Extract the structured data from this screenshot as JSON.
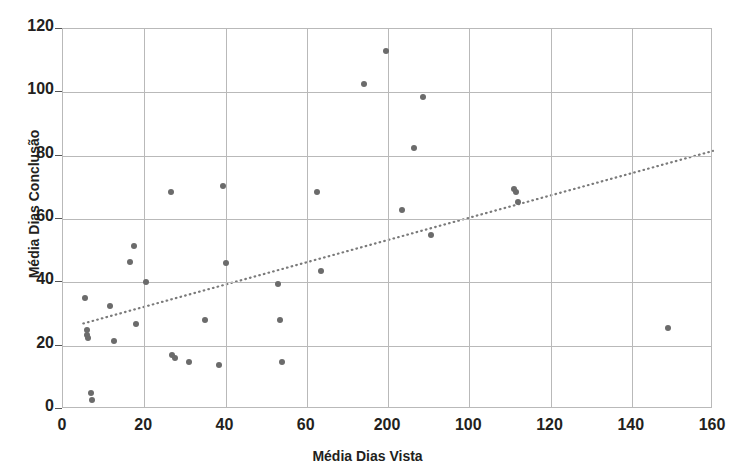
{
  "chart_data": {
    "type": "scatter",
    "title": "",
    "xlabel": "Média Dias Vista",
    "ylabel": "Média Dias Conclusão",
    "xlim": [
      0,
      160
    ],
    "ylim": [
      0,
      120
    ],
    "xticks": [
      0,
      20,
      40,
      60,
      200,
      100,
      120,
      140,
      160
    ],
    "xtick_positions": [
      0,
      20,
      40,
      60,
      80,
      100,
      120,
      140,
      160
    ],
    "yticks": [
      0,
      20,
      40,
      60,
      80,
      100,
      120
    ],
    "grid": true,
    "legend": false,
    "marker_color": "#6b6b6b",
    "trendline_color": "#7a7a7a",
    "series": [
      {
        "name": "Observações",
        "points": [
          [
            5.5,
            35.0
          ],
          [
            6.0,
            25.0
          ],
          [
            6.0,
            23.5
          ],
          [
            6.2,
            22.5
          ],
          [
            7.0,
            5.0
          ],
          [
            7.2,
            3.0
          ],
          [
            11.5,
            32.5
          ],
          [
            12.5,
            21.5
          ],
          [
            16.5,
            46.5
          ],
          [
            17.5,
            51.5
          ],
          [
            18.0,
            27.0
          ],
          [
            20.5,
            40.0
          ],
          [
            26.5,
            68.5
          ],
          [
            26.8,
            17.0
          ],
          [
            27.5,
            16.0
          ],
          [
            31.0,
            15.0
          ],
          [
            35.0,
            28.0
          ],
          [
            38.5,
            14.0
          ],
          [
            39.5,
            70.5
          ],
          [
            40.0,
            46.0
          ],
          [
            53.0,
            39.5
          ],
          [
            53.5,
            28.0
          ],
          [
            54.0,
            15.0
          ],
          [
            62.5,
            68.5
          ],
          [
            63.5,
            43.5
          ],
          [
            74.0,
            102.5
          ],
          [
            79.5,
            113.0
          ],
          [
            83.5,
            63.0
          ],
          [
            86.5,
            82.5
          ],
          [
            88.5,
            98.5
          ],
          [
            90.5,
            55.0
          ],
          [
            111.0,
            69.5
          ],
          [
            111.5,
            68.5
          ],
          [
            112.0,
            65.5
          ],
          [
            149.0,
            25.5
          ]
        ]
      }
    ],
    "trendline": {
      "name": "Linha de tendência",
      "style": "dotted",
      "x_start": 5.0,
      "y_start": 27.0,
      "x_end": 160.0,
      "y_end": 81.5
    }
  }
}
